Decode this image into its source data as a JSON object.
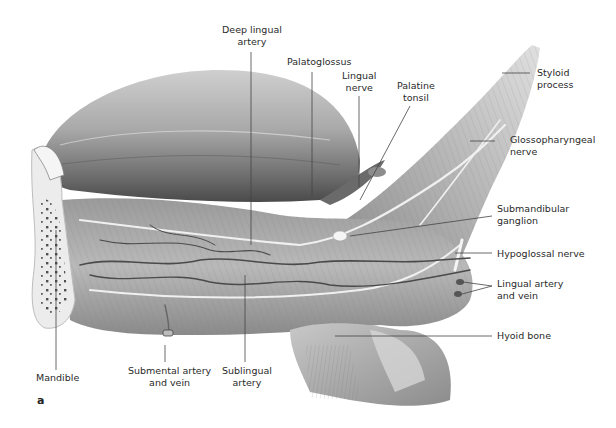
{
  "figure": {
    "panel_letter": "a",
    "colors": {
      "background": "#ffffff",
      "label_text": "#2a2a2a",
      "leader_line": "#444444",
      "tissue_light": "#d8d8d8",
      "tissue_mid": "#a8a8a8",
      "tissue_dark": "#5a5a5a",
      "nerve": "#f2f2f2"
    },
    "labels": {
      "deep_lingual_artery": "Deep lingual\nartery",
      "palatoglossus": "Palatoglossus",
      "lingual_nerve": "Lingual\nnerve",
      "palatine_tonsil": "Palatine\ntonsil",
      "styloid_process": "Styloid\nprocess",
      "glossopharyngeal_nerve": "Glossopharyngeal\nnerve",
      "submandibular_ganglion": "Submandibular\nganglion",
      "hypoglossal_nerve": "Hypoglossal nerve",
      "lingual_artery_and_vein": "Lingual artery\nand vein",
      "hyoid_bone": "Hyoid bone",
      "mandible": "Mandible",
      "submental_artery_and_vein": "Submental artery\nand vein",
      "sublingual_artery": "Sublingual\nartery"
    }
  }
}
